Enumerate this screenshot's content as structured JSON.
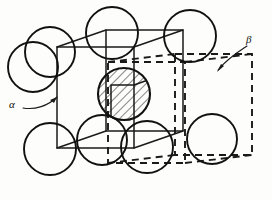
{
  "figure": {
    "background_color": "#fdfdfb",
    "ink_color": "#1a1a1a"
  },
  "labels": {
    "alpha": {
      "text": "α",
      "name": "alpha-cell-label",
      "points_to": "solid-line unit cell"
    },
    "beta": {
      "text": "β",
      "name": "beta-cell-label",
      "points_to": "dashed-line unit cell"
    }
  },
  "cells": {
    "alpha_cell": {
      "name": "solid unit cell",
      "line_style": "solid",
      "front_face": {
        "x": 57,
        "y": 47,
        "w": 77,
        "h": 101
      },
      "depth_dx": 49,
      "depth_dy": -17
    },
    "beta_cell": {
      "name": "dashed unit cell",
      "line_style": "dashed",
      "front_face": {
        "x": 108,
        "y": 62,
        "w": 77,
        "h": 101
      },
      "depth_dx": 67,
      "depth_dy": -8
    }
  },
  "atoms": [
    {
      "name": "atom-top-left",
      "cx": 50,
      "cy": 52,
      "r": 25,
      "fill": "none"
    },
    {
      "name": "atom-top-mid",
      "cx": 112,
      "cy": 33,
      "r": 26,
      "fill": "none"
    },
    {
      "name": "atom-top-right",
      "cx": 190,
      "cy": 36,
      "r": 26,
      "fill": "none"
    },
    {
      "name": "atom-left-edge",
      "cx": 33,
      "cy": 67,
      "r": 25,
      "fill": "none"
    },
    {
      "name": "atom-center-hatched",
      "cx": 124,
      "cy": 94,
      "r": 26,
      "fill": "hatched"
    },
    {
      "name": "atom-right-mid",
      "cx": 212,
      "cy": 139,
      "r": 25,
      "fill": "none"
    },
    {
      "name": "atom-bottom-left",
      "cx": 50,
      "cy": 149,
      "r": 26,
      "fill": "none"
    },
    {
      "name": "atom-bottom-mid",
      "cx": 147,
      "cy": 147,
      "r": 26,
      "fill": "none"
    },
    {
      "name": "atom-bottom-right",
      "cx": 102,
      "cy": 140,
      "r": 25,
      "fill": "none"
    }
  ],
  "hatching": {
    "name": "diagonal-hatch-pattern",
    "angle_degrees": 45,
    "spacing_px": 6,
    "color": "#111111"
  }
}
